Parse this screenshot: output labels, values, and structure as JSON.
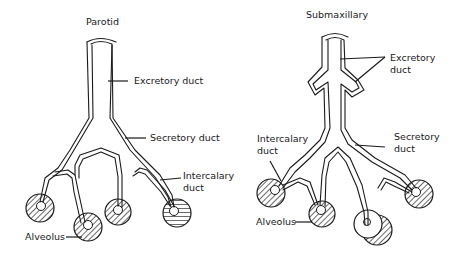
{
  "diagrams": [
    {
      "title": "Parotid",
      "labels": {
        "excretory": "Excretory duct",
        "secretory": "Secretory duct",
        "intercalary_line1": "Intercalary",
        "intercalary_line2": "duct",
        "alveolus": "Alveolus"
      }
    },
    {
      "title": "Submaxillary",
      "labels": {
        "excretory_line1": "Excretory",
        "excretory_line2": "duct",
        "secretory_line1": "Secretory",
        "secretory_line2": "duct",
        "intercalary_line1": "Intercalary",
        "intercalary_line2": "duct",
        "alveolus": "Alveolus"
      }
    }
  ],
  "colors": {
    "line": "#1a1a1a",
    "background": "#ffffff"
  }
}
